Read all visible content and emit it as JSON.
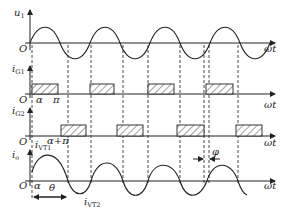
{
  "figure": {
    "axis_labels": {
      "u1": {
        "main": "u",
        "sub": "1"
      },
      "iG1": {
        "main": "i",
        "sub": "G1"
      },
      "iG2": {
        "main": "i",
        "sub": "G2"
      },
      "io": {
        "main": "i",
        "sub": "o"
      },
      "x": "ωt",
      "origin": "O"
    },
    "annotations": {
      "alpha": "α",
      "pi": "π",
      "alpha_plus_pi": "α+π",
      "theta": "θ",
      "phi": "φ",
      "iVT1": {
        "main": "i",
        "sub": "VT1"
      },
      "iVT2": {
        "main": "i",
        "sub": "VT2"
      }
    },
    "colors": {
      "line": "#222222",
      "background": "#ffffff"
    }
  },
  "panels": [
    {
      "name": "u1",
      "axis_y": 43,
      "type": "sine",
      "amplitude": 16,
      "period": 59,
      "start_x": 30
    },
    {
      "name": "iG1",
      "axis_y": 94,
      "pulse_top": 84,
      "pulses": [
        [
          32,
          58
        ],
        [
          90,
          114
        ],
        [
          148,
          174
        ],
        [
          206,
          233
        ]
      ]
    },
    {
      "name": "iG2",
      "axis_y": 136,
      "pulse_top": 125,
      "pulses": [
        [
          61,
          86
        ],
        [
          117,
          143
        ],
        [
          177,
          204
        ],
        [
          236,
          262
        ]
      ]
    },
    {
      "name": "io",
      "axis_y": 181,
      "type": "current"
    }
  ],
  "dashed_lines_x": [
    32,
    68,
    91,
    123,
    148,
    180,
    204,
    209,
    238
  ]
}
